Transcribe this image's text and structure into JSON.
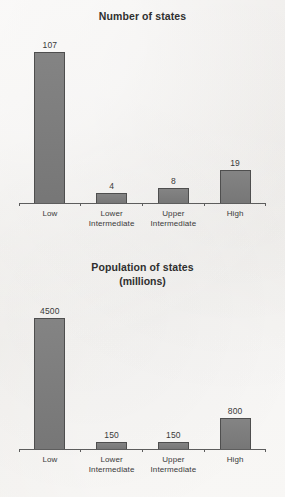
{
  "page": {
    "background_color": "#f1efed",
    "bar_fill_color": "#7d7d7d",
    "bar_edge_color": "#4e4e4e",
    "axis_color": "#5d5d5d",
    "text_color": "#3a3a3a"
  },
  "chart_data": [
    {
      "type": "bar",
      "title": "Number of states",
      "subtitle": "",
      "xlabel": "",
      "ylabel": "",
      "grid": false,
      "legend": "none",
      "y_axis_visible": false,
      "categories": [
        "Low",
        "Lower Intermediate",
        "Upper Intermediate",
        "High"
      ],
      "category_lines": [
        {
          "line1": "Low",
          "line2": ""
        },
        {
          "line1": "Lower",
          "line2": "Intermediate"
        },
        {
          "line1": "Upper",
          "line2": "Intermediate"
        },
        {
          "line1": "High",
          "line2": ""
        }
      ],
      "values": [
        107,
        4,
        8,
        19
      ],
      "value_labels": [
        "107",
        "4",
        "8",
        "19"
      ],
      "bar_heights_px": [
        152,
        11,
        16,
        34
      ]
    },
    {
      "type": "bar",
      "title": "Population of states",
      "subtitle": "(millions)",
      "xlabel": "",
      "ylabel": "",
      "grid": false,
      "legend": "none",
      "y_axis_visible": false,
      "categories": [
        "Low",
        "Lower Intermediate",
        "Upper Intermediate",
        "High"
      ],
      "category_lines": [
        {
          "line1": "Low",
          "line2": ""
        },
        {
          "line1": "Lower",
          "line2": "Intermediate"
        },
        {
          "line1": "Upper",
          "line2": "Intermediate"
        },
        {
          "line1": "High",
          "line2": ""
        }
      ],
      "values": [
        4500,
        150,
        150,
        800
      ],
      "value_labels": [
        "4500",
        "150",
        "150",
        "800"
      ],
      "bar_heights_px": [
        132,
        8,
        8,
        32
      ]
    }
  ]
}
